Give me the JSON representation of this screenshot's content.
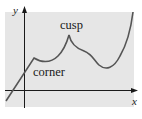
{
  "diagram": {
    "type": "function-graph",
    "background_color": "#ffffff",
    "plot_area_color": "#e6e6e6",
    "curve_color": "#555555",
    "axis_color": "#1a1a1a",
    "axes": {
      "x_label": "x",
      "y_label": "y"
    },
    "annotations": [
      {
        "id": "corner",
        "text": "corner"
      },
      {
        "id": "cusp",
        "text": "cusp"
      }
    ]
  }
}
